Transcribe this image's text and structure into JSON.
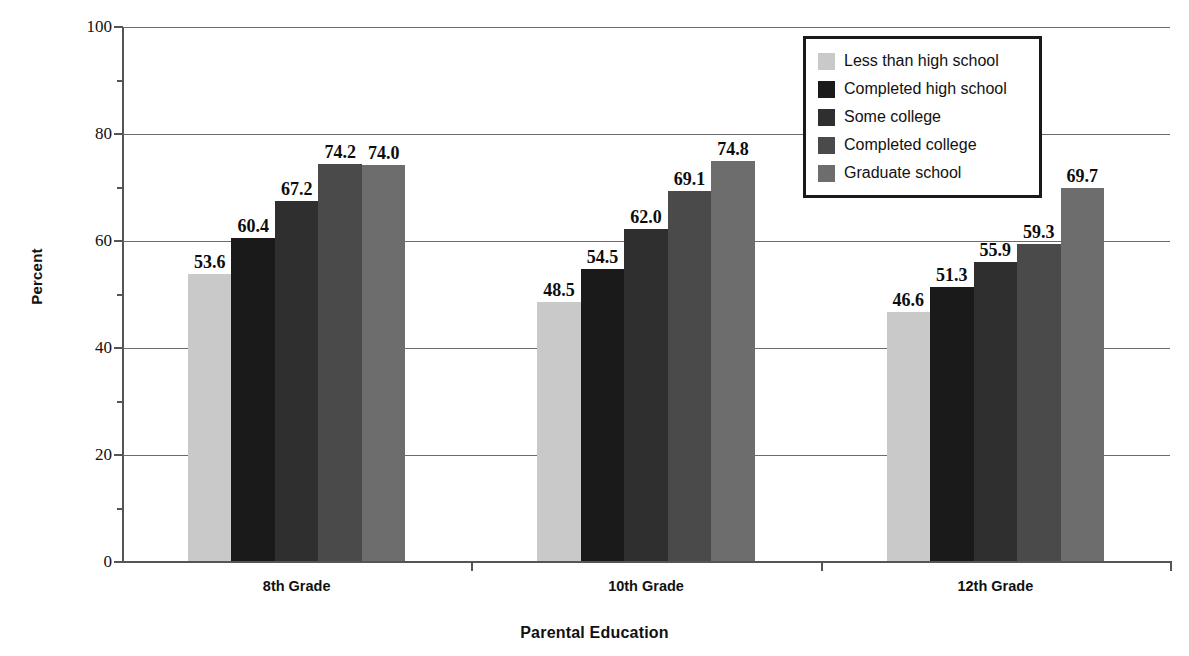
{
  "chart_data": {
    "type": "bar",
    "title": "",
    "xlabel": "Parental Education",
    "ylabel": "Percent",
    "categories": [
      "8th Grade",
      "10th Grade",
      "12th Grade"
    ],
    "series": [
      {
        "name": "Less than high school",
        "color": "#c9c9c9",
        "values": [
          53.6,
          48.5,
          46.6
        ]
      },
      {
        "name": "Completed high school",
        "color": "#1a1a1a",
        "values": [
          60.4,
          54.5,
          51.3
        ]
      },
      {
        "name": "Some college",
        "color": "#2f2f2f",
        "values": [
          67.2,
          62.0,
          55.9
        ]
      },
      {
        "name": "Completed college",
        "color": "#4a4a4a",
        "values": [
          74.2,
          69.1,
          59.3
        ]
      },
      {
        "name": "Graduate school",
        "color": "#6d6d6d",
        "values": [
          74.0,
          74.8,
          69.7
        ]
      }
    ],
    "ylim": [
      0,
      100
    ],
    "yticks": [
      0,
      20,
      40,
      60,
      80,
      100
    ],
    "ytick_labels": [
      "0",
      "20",
      "40",
      "60",
      "80",
      "100"
    ],
    "yminor_ticks": [
      10,
      30,
      50,
      70,
      90
    ],
    "grid": "horizontal",
    "legend_position": "top-right",
    "value_labels": [
      [
        "53.6",
        "60.4",
        "67.2",
        "74.2",
        "74.0"
      ],
      [
        "48.5",
        "54.5",
        "62.0",
        "69.1",
        "74.8"
      ],
      [
        "46.6",
        "51.3",
        "55.9",
        "59.3",
        "69.7"
      ]
    ]
  },
  "axes": {
    "y_title": "Percent",
    "x_title": "Parental Education"
  },
  "legend": {
    "items": [
      {
        "label": "Less than high school"
      },
      {
        "label": "Completed high school"
      },
      {
        "label": "Some college"
      },
      {
        "label": "Completed college"
      },
      {
        "label": "Graduate school"
      }
    ]
  }
}
